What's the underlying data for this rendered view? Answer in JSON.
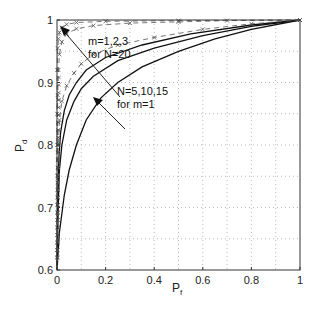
{
  "chart_data": {
    "type": "line",
    "title": "",
    "xlabel": "P_f",
    "ylabel": "P_d",
    "xlim": [
      0,
      1
    ],
    "ylim": [
      0.6,
      1
    ],
    "xticks": [
      "0",
      "0.2",
      "0.4",
      "0.6",
      "0.8",
      "1"
    ],
    "yticks": [
      "0.6",
      "0.7",
      "0.8",
      "0.9",
      "1"
    ],
    "grid": true,
    "legend": null,
    "annotations": [
      {
        "text": "m=1,2,3",
        "text2": "for N=20"
      },
      {
        "text": "N=5,10,15",
        "text2": "for m=1"
      }
    ],
    "series": [
      {
        "name": "N=5, m=1",
        "style": "solid",
        "x": [
          0,
          0.01,
          0.03,
          0.05,
          0.08,
          0.12,
          0.18,
          0.25,
          0.35,
          0.5,
          0.65,
          0.8,
          1.0
        ],
        "y": [
          0.6,
          0.66,
          0.72,
          0.76,
          0.8,
          0.84,
          0.875,
          0.9,
          0.925,
          0.95,
          0.97,
          0.985,
          1.0
        ]
      },
      {
        "name": "N=10, m=1",
        "style": "solid",
        "x": [
          0,
          0.005,
          0.01,
          0.02,
          0.04,
          0.07,
          0.1,
          0.15,
          0.25,
          0.4,
          0.6,
          0.8,
          1.0
        ],
        "y": [
          0.6,
          0.7,
          0.76,
          0.8,
          0.84,
          0.87,
          0.89,
          0.91,
          0.935,
          0.955,
          0.975,
          0.99,
          1.0
        ]
      },
      {
        "name": "N=15, m=1",
        "style": "solid",
        "x": [
          0,
          0.003,
          0.008,
          0.015,
          0.03,
          0.05,
          0.08,
          0.12,
          0.2,
          0.35,
          0.55,
          0.8,
          1.0
        ],
        "y": [
          0.6,
          0.72,
          0.78,
          0.82,
          0.855,
          0.88,
          0.9,
          0.92,
          0.94,
          0.96,
          0.978,
          0.992,
          1.0
        ]
      },
      {
        "name": "N=20, m=1",
        "style": "dashed-x",
        "x": [
          0,
          0.002,
          0.005,
          0.01,
          0.02,
          0.04,
          0.07,
          0.1,
          0.15,
          0.25,
          0.4,
          0.6,
          0.8,
          1.0
        ],
        "y": [
          0.6,
          0.75,
          0.8,
          0.84,
          0.87,
          0.895,
          0.915,
          0.93,
          0.945,
          0.96,
          0.972,
          0.985,
          0.994,
          1.0
        ]
      },
      {
        "name": "N=20, m=2",
        "style": "dashed-x",
        "x": [
          0,
          0.001,
          0.003,
          0.006,
          0.01,
          0.02,
          0.04,
          0.08,
          0.15,
          0.3,
          0.5,
          0.7,
          1.0
        ],
        "y": [
          0.6,
          0.8,
          0.88,
          0.92,
          0.945,
          0.965,
          0.978,
          0.986,
          0.991,
          0.995,
          0.997,
          0.999,
          1.0
        ]
      },
      {
        "name": "N=20, m=3",
        "style": "dashed-x",
        "x": [
          0,
          0.0005,
          0.001,
          0.003,
          0.006,
          0.01,
          0.02,
          0.04,
          0.08,
          0.2,
          0.5,
          1.0
        ],
        "y": [
          0.6,
          0.85,
          0.92,
          0.955,
          0.97,
          0.98,
          0.988,
          0.993,
          0.996,
          0.998,
          0.999,
          1.0
        ]
      }
    ]
  }
}
